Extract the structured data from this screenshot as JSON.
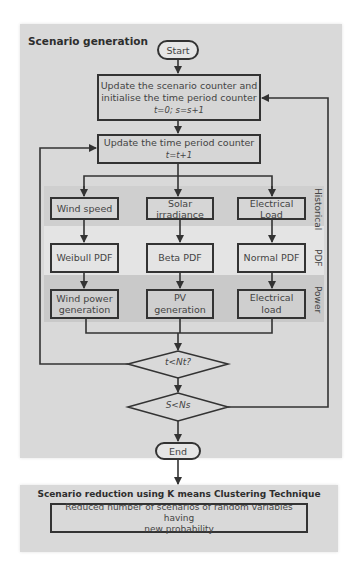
{
  "scenario_generation": {
    "title": "Scenario generation",
    "start_label": "Start",
    "end_label": "End",
    "step_update_scenario": {
      "line1": "Update the scenario counter and",
      "line2": "initialise the time period counter",
      "formula": "t=0; s=s+1"
    },
    "step_update_time": {
      "line1": "Update the time period counter",
      "formula": "t=t+1"
    },
    "bands": {
      "historical": "Historical",
      "pdf": "PDF",
      "power": "Power"
    },
    "columns": [
      {
        "historical": "Wind speed",
        "pdf": "Weibull PDF",
        "power_line1": "Wind power",
        "power_line2": "generation"
      },
      {
        "historical_line1": "Solar",
        "historical_line2": "irradiance",
        "pdf": "Beta PDF",
        "power": "PV generation"
      },
      {
        "historical_line1": "Electrical",
        "historical_line2": "Load",
        "pdf": "Normal PDF",
        "power": "Electrical load"
      }
    ],
    "decision_time": "t<Nt?",
    "decision_scenario": "S<Ns"
  },
  "scenario_reduction": {
    "title": "Scenario reduction using K means Clustering Technique",
    "result_line1": "Reduced number of scenarios of random variables having",
    "result_line2": "new probability"
  },
  "colors": {
    "panel": "#d9d9d9",
    "band_historical": "#cfcfcf",
    "band_pdf": "#e4e4e4",
    "band_power": "#c9c9c9",
    "stroke": "#333333"
  }
}
